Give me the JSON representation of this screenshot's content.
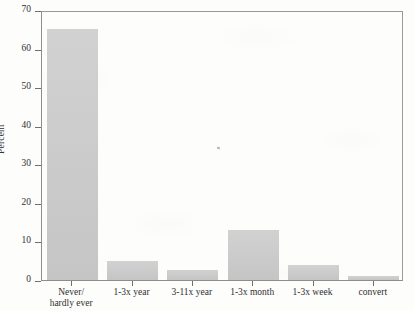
{
  "chart_data": {
    "type": "bar",
    "title": "",
    "subtitle": "",
    "xlabel": "",
    "ylabel": "Percent",
    "categories": [
      "Never/\nhardly ever",
      "1-3x year",
      "3-11x year",
      "1-3x month",
      "1-3x week",
      "convert"
    ],
    "values": [
      65,
      5,
      2.6,
      13,
      4,
      1
    ],
    "ylim": [
      0,
      70
    ],
    "yticks": [
      0,
      10,
      20,
      30,
      40,
      50,
      60,
      70
    ],
    "ytick_labels": [
      "0",
      "10",
      "20",
      "30",
      "40",
      "50",
      "60",
      "70"
    ],
    "grid": false,
    "legend": null,
    "bar_color": "#c9c9c9",
    "axis_color": "#8e8e8e",
    "annotations": []
  },
  "figure": {
    "background_color": "#fdfdfc",
    "frame_color": "#8e8e8e"
  }
}
